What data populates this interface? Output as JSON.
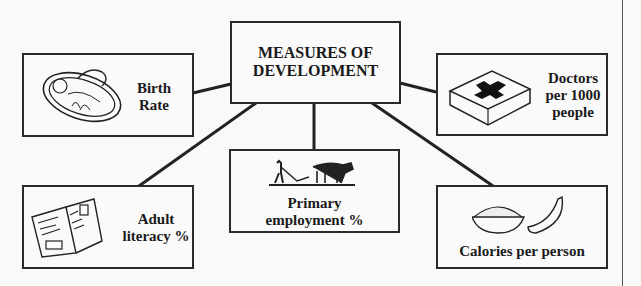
{
  "diagram": {
    "title": "MEASURES OF DEVELOPMENT",
    "title_lines": [
      "MEASURES OF",
      "DEVELOPMENT"
    ],
    "nodes": [
      {
        "id": "birth-rate",
        "lines": [
          "Birth",
          "Rate"
        ],
        "icon": "baby-basket-icon"
      },
      {
        "id": "doctors",
        "lines": [
          "Doctors",
          "per 1000",
          "people"
        ],
        "icon": "first-aid-box-icon"
      },
      {
        "id": "primary-employment",
        "lines": [
          "Primary",
          "employment %"
        ],
        "icon": "ox-plough-icon"
      },
      {
        "id": "adult-literacy",
        "lines": [
          "Adult",
          "literacy %"
        ],
        "icon": "open-book-icon"
      },
      {
        "id": "calories",
        "lines": [
          "Calories per person"
        ],
        "icon": "food-bowl-banana-icon"
      }
    ],
    "edges": [
      [
        "center",
        "birth-rate"
      ],
      [
        "center",
        "doctors"
      ],
      [
        "center",
        "primary-employment"
      ],
      [
        "center",
        "adult-literacy"
      ],
      [
        "center",
        "calories"
      ]
    ]
  }
}
